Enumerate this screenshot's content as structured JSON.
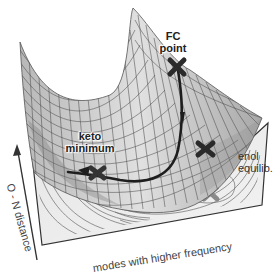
{
  "diagram": {
    "type": "potential-energy-surface",
    "labels": {
      "fc_point_line1": "FC",
      "fc_point_line2": "point",
      "keto_line1": "keto",
      "keto_line2": "minimum",
      "enol_line1": "enol",
      "enol_line2": "equilib."
    },
    "axes": {
      "x_label": "modes with higher frequency",
      "y_label": "O - N distance"
    },
    "markers": [
      {
        "name": "FC point",
        "symbol": "X"
      },
      {
        "name": "keto minimum",
        "symbol": "X"
      },
      {
        "name": "enol equilibrium",
        "symbol": "X"
      },
      {
        "name": "keto projection",
        "symbol": "X"
      },
      {
        "name": "enol projection",
        "symbol": "X"
      }
    ],
    "colors": {
      "surface": "#c8c8c8",
      "mesh": "#555555",
      "path": "#222222",
      "contour": "#666666",
      "marker": "#333333",
      "projection_marker": "#888888"
    }
  }
}
